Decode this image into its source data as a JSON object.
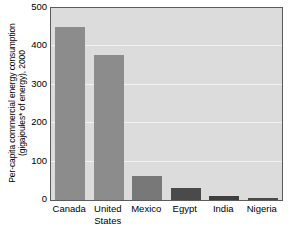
{
  "chart_data": {
    "type": "bar",
    "title": "",
    "xlabel": "",
    "ylabel_line1": "Per-capita commercial energy consumption",
    "ylabel_line2": "(gigajoules* of energy), 2000",
    "categories": [
      "Canada",
      "United States",
      "Mexico",
      "Egypt",
      "India",
      "Nigeria"
    ],
    "category_lines": [
      [
        "Canada"
      ],
      [
        "United",
        "States"
      ],
      [
        "Mexico"
      ],
      [
        "Egypt"
      ],
      [
        "India"
      ],
      [
        "Nigeria"
      ]
    ],
    "values": [
      450,
      378,
      62,
      30,
      11,
      5
    ],
    "bar_colors": [
      "#8c8c8c",
      "#8c8c8c",
      "#787878",
      "#4a4a4a",
      "#3f3f3f",
      "#4a4a4a"
    ],
    "ylim": [
      0,
      500
    ],
    "yticks": [
      0,
      100,
      200,
      300,
      400,
      500
    ],
    "ytick_labels": [
      "0",
      "100",
      "200",
      "300",
      "400",
      "500"
    ],
    "grid": true,
    "grid_color": "#f2f2f2",
    "legend": "none",
    "plot_background": "#dcdcdc",
    "frame_color": "#5b5b5b",
    "page_background": "#ffffff"
  }
}
